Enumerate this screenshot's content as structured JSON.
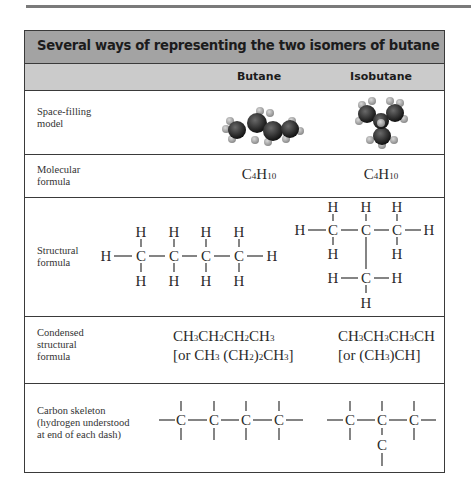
{
  "title": "Several ways of representing the two isomers of butane",
  "columns": [
    "Butane",
    "Isobutane"
  ],
  "rows": [
    {
      "label_lines": [
        "Space-filling",
        "model"
      ],
      "butane": "space-filling-model-butane",
      "isobutane": "space-filling-model-isobutane"
    },
    {
      "label_lines": [
        "Molecular",
        "formula"
      ],
      "butane": {
        "C": "C",
        "c_sub": "4",
        "H": "H",
        "h_sub": "10"
      },
      "isobutane": {
        "C": "C",
        "c_sub": "4",
        "H": "H",
        "h_sub": "10"
      }
    },
    {
      "label_lines": [
        "Structural",
        "formula"
      ],
      "atoms": {
        "carbon": "C",
        "hydrogen": "H"
      }
    },
    {
      "label_lines": [
        "Condensed",
        "structural",
        "formula"
      ],
      "butane": {
        "line1": [
          [
            "CH",
            "3"
          ],
          [
            "CH",
            "2"
          ],
          [
            "CH",
            "2"
          ],
          [
            "CH",
            "3"
          ]
        ],
        "line2": [
          "[or CH",
          "3",
          " (CH",
          "2",
          ")",
          "2",
          "CH",
          "3",
          "]"
        ]
      },
      "isobutane": {
        "line1": [
          [
            "CH",
            "3"
          ],
          [
            "CH",
            "3"
          ],
          [
            "CH",
            "3"
          ],
          [
            "CH",
            ""
          ]
        ],
        "line2": [
          "[or (CH",
          "3",
          ")CH]"
        ]
      }
    },
    {
      "label_lines": [
        "Carbon skeleton",
        "(hydrogen understood",
        "at end of each dash)"
      ],
      "atoms": {
        "carbon": "C"
      }
    }
  ],
  "colors": {
    "title_bar": "#a3a3a3",
    "sub_bar": "#cbcbcb",
    "border": "#3a3a3a"
  }
}
